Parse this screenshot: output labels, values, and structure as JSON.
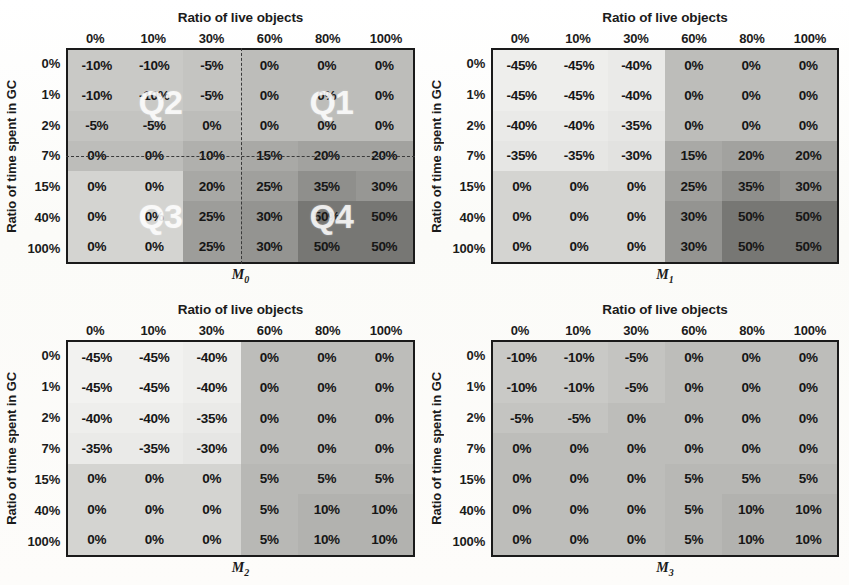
{
  "figure": {
    "axis": {
      "x_title": "Ratio of live objects",
      "y_title": "Ratio of time spent in GC"
    },
    "col_headers": [
      "0%",
      "10%",
      "30%",
      "60%",
      "80%",
      "100%"
    ],
    "row_headers": [
      "0%",
      "1%",
      "2%",
      "7%",
      "15%",
      "40%",
      "100%"
    ],
    "colors": {
      "page_background": "#fdfdfb",
      "grid_border": "#1a1a1a",
      "text": "#161616",
      "quadrant_label": "#ffffff",
      "quadrant_divider": "#3a3a3a",
      "scale_lightest": "#f7f7f5",
      "scale_light": "#e9e9e6",
      "scale_mid_light": "#d4d4d1",
      "scale_mid": "#bdbdba",
      "scale_mid_dark": "#a8a8a5",
      "scale_dark": "#8e8e8b",
      "scale_darkest": "#767673"
    }
  },
  "panels": [
    {
      "id": "M0",
      "label": "M",
      "subscript": "0",
      "quadrants": {
        "enabled": true,
        "v_divider_after_col": 3,
        "h_divider_after_row": 3,
        "labels": [
          {
            "name": "Q2",
            "text": "Q2",
            "left_pct": 27,
            "top_pct": 25
          },
          {
            "name": "Q1",
            "text": "Q1",
            "left_pct": 76,
            "top_pct": 25
          },
          {
            "name": "Q3",
            "text": "Q3",
            "left_pct": 27,
            "top_pct": 78
          },
          {
            "name": "Q4",
            "text": "Q4",
            "left_pct": 76,
            "top_pct": 78
          }
        ]
      },
      "values": [
        [
          "-10%",
          "-10%",
          "-5%",
          "0%",
          "0%",
          "0%"
        ],
        [
          "-10%",
          "-10%",
          "-5%",
          "0%",
          "0%",
          "0%"
        ],
        [
          "-5%",
          "-5%",
          "0%",
          "0%",
          "0%",
          "0%"
        ],
        [
          "0%",
          "0%",
          "10%",
          "15%",
          "20%",
          "20%"
        ],
        [
          "0%",
          "0%",
          "20%",
          "25%",
          "35%",
          "30%"
        ],
        [
          "0%",
          "0%",
          "25%",
          "30%",
          "50%",
          "50%"
        ],
        [
          "0%",
          "0%",
          "25%",
          "30%",
          "50%",
          "50%"
        ]
      ],
      "shades": [
        [
          "#c9c9c6",
          "#c9c9c6",
          "#c4c4c1",
          "#bdbdba",
          "#bdbdba",
          "#bdbdba"
        ],
        [
          "#c9c9c6",
          "#c9c9c6",
          "#c4c4c1",
          "#bdbdba",
          "#bdbdba",
          "#bdbdba"
        ],
        [
          "#c4c4c1",
          "#c4c4c1",
          "#bdbdba",
          "#bdbdba",
          "#bdbdba",
          "#bdbdba"
        ],
        [
          "#bdbdba",
          "#bdbdba",
          "#b0b0ad",
          "#a9a9a6",
          "#a2a29f",
          "#a2a29f"
        ],
        [
          "#d4d4d1",
          "#d4d4d1",
          "#a8a8a5",
          "#a0a09d",
          "#8f8f8c",
          "#97979 4"
        ],
        [
          "#d4d4d1",
          "#d4d4d1",
          "#9d9d9a",
          "#949491",
          "#77777 4",
          "#777774"
        ],
        [
          "#d4d4d1",
          "#d4d4d1",
          "#9d9d9a",
          "#949491",
          "#777774",
          "#777774"
        ]
      ]
    },
    {
      "id": "M1",
      "label": "M",
      "subscript": "1",
      "quadrants": {
        "enabled": false,
        "labels": []
      },
      "values": [
        [
          "-45%",
          "-45%",
          "-40%",
          "0%",
          "0%",
          "0%"
        ],
        [
          "-45%",
          "-45%",
          "-40%",
          "0%",
          "0%",
          "0%"
        ],
        [
          "-40%",
          "-40%",
          "-35%",
          "0%",
          "0%",
          "0%"
        ],
        [
          "-35%",
          "-35%",
          "-30%",
          "15%",
          "20%",
          "20%"
        ],
        [
          "0%",
          "0%",
          "0%",
          "25%",
          "35%",
          "30%"
        ],
        [
          "0%",
          "0%",
          "0%",
          "30%",
          "50%",
          "50%"
        ],
        [
          "0%",
          "0%",
          "0%",
          "30%",
          "50%",
          "50%"
        ]
      ],
      "shades": [
        [
          "#eeeeec",
          "#eeeeec",
          "#eaeae8",
          "#bdbdba",
          "#bdbdba",
          "#bdbdba"
        ],
        [
          "#eeeeec",
          "#eeeeec",
          "#eaeae8",
          "#bdbdba",
          "#bdbdba",
          "#bdbdba"
        ],
        [
          "#eaeae8",
          "#eaeae8",
          "#e6e6e4",
          "#bdbdba",
          "#bdbdba",
          "#bdbdba"
        ],
        [
          "#e6e6e4",
          "#e6e6e4",
          "#e2e2e0",
          "#a9a9a6",
          "#a2a29f",
          "#a2a29f"
        ],
        [
          "#d4d4d1",
          "#d4d4d1",
          "#d4d4d1",
          "#a0a09d",
          "#8f8f8c",
          "#979794"
        ],
        [
          "#d4d4d1",
          "#d4d4d1",
          "#d4d4d1",
          "#949491",
          "#777774",
          "#777774"
        ],
        [
          "#d4d4d1",
          "#d4d4d1",
          "#d4d4d1",
          "#949491",
          "#777774",
          "#777774"
        ]
      ]
    },
    {
      "id": "M2",
      "label": "M",
      "subscript": "2",
      "quadrants": {
        "enabled": false,
        "labels": []
      },
      "values": [
        [
          "-45%",
          "-45%",
          "-40%",
          "0%",
          "0%",
          "0%"
        ],
        [
          "-45%",
          "-45%",
          "-40%",
          "0%",
          "0%",
          "0%"
        ],
        [
          "-40%",
          "-40%",
          "-35%",
          "0%",
          "0%",
          "0%"
        ],
        [
          "-35%",
          "-35%",
          "-30%",
          "0%",
          "0%",
          "0%"
        ],
        [
          "0%",
          "0%",
          "0%",
          "5%",
          "5%",
          "5%"
        ],
        [
          "0%",
          "0%",
          "0%",
          "5%",
          "10%",
          "10%"
        ],
        [
          "0%",
          "0%",
          "0%",
          "5%",
          "10%",
          "10%"
        ]
      ],
      "shades": [
        [
          "#f2f2f0",
          "#f2f2f0",
          "#eeeeec",
          "#bdbdba",
          "#bdbdba",
          "#bdbdba"
        ],
        [
          "#f2f2f0",
          "#f2f2f0",
          "#eeeeec",
          "#bdbdba",
          "#bdbdba",
          "#bdbdba"
        ],
        [
          "#eeeeec",
          "#eeeeec",
          "#eaeae8",
          "#bdbdba",
          "#bdbdba",
          "#bdbdba"
        ],
        [
          "#eaeae8",
          "#eaeae8",
          "#e6e6e4",
          "#bdbdba",
          "#bdbdba",
          "#bdbdba"
        ],
        [
          "#d4d4d1",
          "#d4d4d1",
          "#d4d4d1",
          "#b8b8b5",
          "#b8b8b5",
          "#b8b8b5"
        ],
        [
          "#d4d4d1",
          "#d4d4d1",
          "#d4d4d1",
          "#b8b8b5",
          "#b2b2af",
          "#b2b2af"
        ],
        [
          "#d4d4d1",
          "#d4d4d1",
          "#d4d4d1",
          "#b8b8b5",
          "#b2b2af",
          "#b2b2af"
        ]
      ]
    },
    {
      "id": "M3",
      "label": "M",
      "subscript": "3",
      "quadrants": {
        "enabled": false,
        "labels": []
      },
      "values": [
        [
          "-10%",
          "-10%",
          "-5%",
          "0%",
          "0%",
          "0%"
        ],
        [
          "-10%",
          "-10%",
          "-5%",
          "0%",
          "0%",
          "0%"
        ],
        [
          "-5%",
          "-5%",
          "0%",
          "0%",
          "0%",
          "0%"
        ],
        [
          "0%",
          "0%",
          "0%",
          "0%",
          "0%",
          "0%"
        ],
        [
          "0%",
          "0%",
          "0%",
          "5%",
          "5%",
          "5%"
        ],
        [
          "0%",
          "0%",
          "0%",
          "5%",
          "10%",
          "10%"
        ],
        [
          "0%",
          "0%",
          "0%",
          "5%",
          "10%",
          "10%"
        ]
      ],
      "shades": [
        [
          "#c9c9c6",
          "#c9c9c6",
          "#c4c4c1",
          "#bdbdba",
          "#bdbdba",
          "#bdbdba"
        ],
        [
          "#c9c9c6",
          "#c9c9c6",
          "#c4c4c1",
          "#bdbdba",
          "#bdbdba",
          "#bdbdba"
        ],
        [
          "#c4c4c1",
          "#c4c4c1",
          "#bdbdba",
          "#bdbdba",
          "#bdbdba",
          "#bdbdba"
        ],
        [
          "#bdbdba",
          "#bdbdba",
          "#bdbdba",
          "#bdbdba",
          "#bdbdba",
          "#bdbdba"
        ],
        [
          "#bdbdba",
          "#bdbdba",
          "#bdbdba",
          "#b8b8b5",
          "#b8b8b5",
          "#b8b8b5"
        ],
        [
          "#bdbdba",
          "#bdbdba",
          "#bdbdba",
          "#b8b8b5",
          "#b2b2af",
          "#b2b2af"
        ],
        [
          "#bdbdba",
          "#bdbdba",
          "#bdbdba",
          "#b8b8b5",
          "#b2b2af",
          "#b2b2af"
        ]
      ]
    }
  ],
  "chart_data": {
    "type": "heatmap",
    "title": "",
    "xlabel": "Ratio of live objects",
    "ylabel": "Ratio of time spent in GC",
    "x": [
      "0%",
      "10%",
      "30%",
      "60%",
      "80%",
      "100%"
    ],
    "y": [
      "0%",
      "1%",
      "2%",
      "7%",
      "15%",
      "40%",
      "100%"
    ],
    "grid": true,
    "legend": "none",
    "panels": [
      {
        "name": "M0",
        "z": [
          [
            -10,
            -10,
            -5,
            0,
            0,
            0
          ],
          [
            -10,
            -10,
            -5,
            0,
            0,
            0
          ],
          [
            -5,
            -5,
            0,
            0,
            0,
            0
          ],
          [
            0,
            0,
            10,
            15,
            20,
            20
          ],
          [
            0,
            0,
            20,
            25,
            35,
            30
          ],
          [
            0,
            0,
            25,
            30,
            50,
            50
          ],
          [
            0,
            0,
            25,
            30,
            50,
            50
          ]
        ],
        "annotations": [
          "Q1",
          "Q2",
          "Q3",
          "Q4"
        ]
      },
      {
        "name": "M1",
        "z": [
          [
            -45,
            -45,
            -40,
            0,
            0,
            0
          ],
          [
            -45,
            -45,
            -40,
            0,
            0,
            0
          ],
          [
            -40,
            -40,
            -35,
            0,
            0,
            0
          ],
          [
            -35,
            -35,
            -30,
            15,
            20,
            20
          ],
          [
            0,
            0,
            0,
            25,
            35,
            30
          ],
          [
            0,
            0,
            0,
            30,
            50,
            50
          ],
          [
            0,
            0,
            0,
            30,
            50,
            50
          ]
        ],
        "annotations": []
      },
      {
        "name": "M2",
        "z": [
          [
            -45,
            -45,
            -40,
            0,
            0,
            0
          ],
          [
            -45,
            -45,
            -40,
            0,
            0,
            0
          ],
          [
            -40,
            -40,
            -35,
            0,
            0,
            0
          ],
          [
            -35,
            -35,
            -30,
            0,
            0,
            0
          ],
          [
            0,
            0,
            0,
            5,
            5,
            5
          ],
          [
            0,
            0,
            0,
            5,
            10,
            10
          ],
          [
            0,
            0,
            0,
            5,
            10,
            10
          ]
        ],
        "annotations": []
      },
      {
        "name": "M3",
        "z": [
          [
            -10,
            -10,
            -5,
            0,
            0,
            0
          ],
          [
            -10,
            -10,
            -5,
            0,
            0,
            0
          ],
          [
            -5,
            -5,
            0,
            0,
            0,
            0
          ],
          [
            0,
            0,
            0,
            0,
            0,
            0
          ],
          [
            0,
            0,
            0,
            5,
            5,
            5
          ],
          [
            0,
            0,
            0,
            5,
            10,
            10
          ],
          [
            0,
            0,
            0,
            5,
            10,
            10
          ]
        ],
        "annotations": []
      }
    ],
    "units": "percent",
    "colorscale": "grayscale: light = negative, dark = positive"
  }
}
